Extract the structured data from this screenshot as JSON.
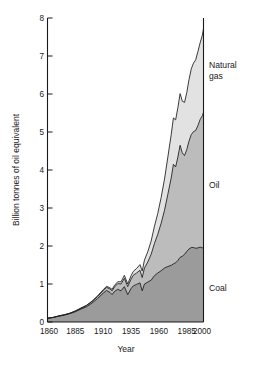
{
  "chart_data": {
    "type": "area",
    "stacked": true,
    "title": "",
    "xlabel": "Year",
    "ylabel": "Billion tonnes of oil equivalent",
    "xlim": [
      1860,
      2000
    ],
    "ylim": [
      0,
      8
    ],
    "grid": false,
    "legend_position": "right-inline-labels",
    "xticks": [
      1860,
      1885,
      1910,
      1935,
      1960,
      1985,
      2000
    ],
    "xtick_labels": [
      "1860",
      "1885",
      "1910",
      "1935",
      "1960",
      "1985",
      "2000"
    ],
    "yticks": [
      0,
      1,
      2,
      3,
      4,
      5,
      6,
      7,
      8
    ],
    "ytick_labels": [
      "0",
      "1",
      "2",
      "3",
      "4",
      "5",
      "6",
      "7",
      "8"
    ],
    "x": [
      1860,
      1865,
      1870,
      1875,
      1880,
      1885,
      1890,
      1895,
      1900,
      1905,
      1910,
      1913,
      1916,
      1918,
      1920,
      1923,
      1926,
      1929,
      1932,
      1935,
      1937,
      1940,
      1943,
      1945,
      1947,
      1950,
      1953,
      1956,
      1959,
      1962,
      1965,
      1968,
      1971,
      1973,
      1975,
      1977,
      1979,
      1981,
      1983,
      1985,
      1987,
      1989,
      1991,
      1993,
      1995,
      1997,
      1999,
      2000
    ],
    "series": [
      {
        "name": "Coal",
        "color": "#9b9b9b",
        "values": [
          0.1,
          0.12,
          0.15,
          0.18,
          0.22,
          0.27,
          0.34,
          0.4,
          0.5,
          0.62,
          0.76,
          0.83,
          0.78,
          0.72,
          0.8,
          0.86,
          0.82,
          0.93,
          0.72,
          0.88,
          0.95,
          0.99,
          1.03,
          0.82,
          1.0,
          1.05,
          1.1,
          1.22,
          1.29,
          1.35,
          1.42,
          1.46,
          1.49,
          1.53,
          1.56,
          1.62,
          1.7,
          1.73,
          1.78,
          1.86,
          1.92,
          1.96,
          1.96,
          1.94,
          1.95,
          1.97,
          1.95,
          1.97
        ]
      },
      {
        "name": "Oil",
        "color": "#bcbcbc",
        "values": [
          0.0,
          0.0,
          0.01,
          0.01,
          0.01,
          0.02,
          0.02,
          0.03,
          0.04,
          0.05,
          0.07,
          0.08,
          0.09,
          0.1,
          0.12,
          0.15,
          0.18,
          0.22,
          0.21,
          0.25,
          0.28,
          0.3,
          0.33,
          0.35,
          0.42,
          0.53,
          0.68,
          0.85,
          1.02,
          1.25,
          1.52,
          1.9,
          2.3,
          2.62,
          2.52,
          2.72,
          2.95,
          2.72,
          2.6,
          2.68,
          2.84,
          2.97,
          3.05,
          3.1,
          3.22,
          3.36,
          3.48,
          3.55
        ]
      },
      {
        "name": "Natural gas",
        "color": "#e2e2e2",
        "values": [
          0.0,
          0.0,
          0.0,
          0.0,
          0.0,
          0.0,
          0.01,
          0.01,
          0.01,
          0.02,
          0.02,
          0.03,
          0.03,
          0.04,
          0.04,
          0.05,
          0.06,
          0.08,
          0.07,
          0.09,
          0.1,
          0.12,
          0.15,
          0.17,
          0.21,
          0.27,
          0.35,
          0.45,
          0.55,
          0.68,
          0.82,
          0.98,
          1.14,
          1.22,
          1.24,
          1.3,
          1.36,
          1.36,
          1.4,
          1.5,
          1.62,
          1.73,
          1.8,
          1.86,
          1.95,
          2.02,
          2.12,
          2.2
        ]
      }
    ],
    "annotations": [
      {
        "text": "Natural",
        "series": "Natural gas",
        "line": 1
      },
      {
        "text": "gas",
        "series": "Natural gas",
        "line": 2
      },
      {
        "text": "Oil",
        "series": "Oil",
        "line": 1
      },
      {
        "text": "Coal",
        "series": "Coal",
        "line": 1
      }
    ]
  },
  "labels": {
    "ylabel": "Billion tonnes of oil equivalent",
    "xlabel": "Year",
    "gas_line1": "Natural",
    "gas_line2": "gas",
    "oil": "Oil",
    "coal": "Coal",
    "y_0": "0",
    "y_1": "1",
    "y_2": "2",
    "y_3": "3",
    "y_4": "4",
    "y_5": "5",
    "y_6": "6",
    "y_7": "7",
    "y_8": "8",
    "x_1860": "1860",
    "x_1885": "1885",
    "x_1910": "1910",
    "x_1935": "1935",
    "x_1960": "1960",
    "x_1985": "1985",
    "x_2000": "2000"
  },
  "colors": {
    "coal": "#9b9b9b",
    "oil": "#bcbcbc",
    "gas": "#e2e2e2",
    "axis": "#1a1a1a",
    "background": "#ffffff"
  }
}
